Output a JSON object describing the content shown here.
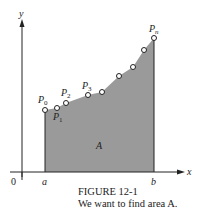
{
  "figure": {
    "title": "FIGURE 12-1",
    "caption": "We want to find area A.",
    "axis_x_label": "x",
    "axis_y_label": "y",
    "origin_label": "0",
    "a_label": "a",
    "b_label": "b",
    "area_label": "A",
    "point_labels": [
      "P0",
      "P1",
      "P2",
      "P3",
      "Pn"
    ],
    "fill_color": "#9a9a9a"
  }
}
